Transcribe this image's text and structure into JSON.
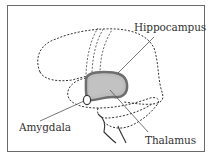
{
  "diagram": {
    "labels": {
      "hippocampus": "Hippocampus",
      "amygdala": "Amygdala",
      "thalamus": "Thalamus"
    },
    "colors": {
      "border": "#6a6a6a",
      "outline": "#333333",
      "hippocampus_fill": "#bdbdbd",
      "hippocampus_stroke": "#6e6e6e",
      "leader_line": "#555555"
    }
  }
}
